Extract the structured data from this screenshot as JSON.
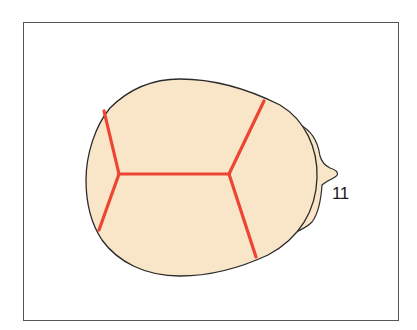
{
  "diagram": {
    "type": "skull-top-view",
    "colors": {
      "fill": "#F9E6C8",
      "outline": "#2b2b2b",
      "suture": "#EE4433",
      "frame": "#555555"
    },
    "labels": [
      {
        "id": "label-11",
        "text": "11"
      }
    ]
  }
}
